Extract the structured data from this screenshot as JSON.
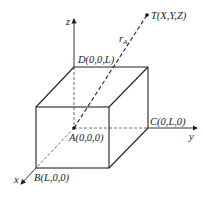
{
  "diagram": {
    "axes": {
      "x": "x",
      "y": "y",
      "z": "z"
    },
    "points": {
      "A": "A(0,0,0)",
      "B": "B(L,0,0)",
      "C": "C(0,L,0)",
      "D": "D(0,0,L)",
      "T": "T(X,Y,Z)"
    },
    "vector_label": "r",
    "vector_subscript": "A",
    "colors": {
      "line": "#222222",
      "background": "#ffffff"
    }
  }
}
